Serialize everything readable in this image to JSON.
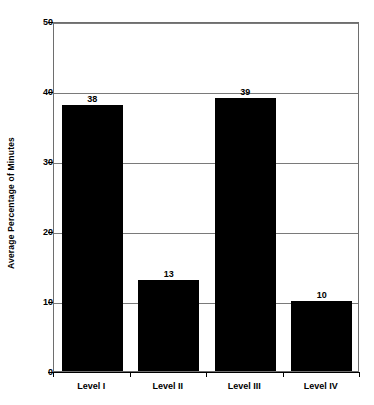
{
  "chart_data": {
    "type": "bar",
    "title": "",
    "subtitle": "",
    "xlabel": "",
    "ylabel": "Average Percentage of Minutes",
    "categories": [
      "Level I",
      "Level II",
      "Level III",
      "Level IV"
    ],
    "values": [
      38,
      13,
      39,
      10
    ],
    "data_labels": [
      "38",
      "13",
      "39",
      "10"
    ],
    "ylim": [
      0,
      50
    ],
    "y_ticks": [
      0,
      10,
      20,
      30,
      40,
      50
    ],
    "y_tick_labels": [
      "0",
      "10",
      "20",
      "30",
      "40",
      "50"
    ],
    "grid": true,
    "grid_orientation": "horizontal",
    "legend": false,
    "legend_position": "none",
    "bar_color": "#000000",
    "plot_background": "#ffffff",
    "frame_color": "#6e6e6e",
    "gridline_color": "#7a7a7a",
    "axis_color": "#000000"
  }
}
